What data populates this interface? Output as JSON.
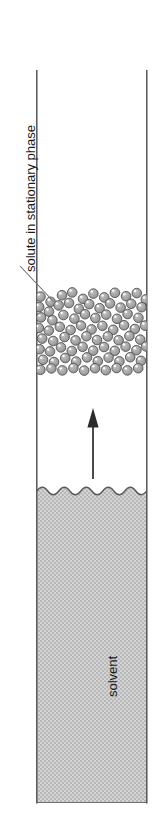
{
  "figure": {
    "background_color": "#ffffff",
    "width": 164,
    "height": 840
  },
  "labels": {
    "solute": "solute in stationary phase",
    "solvent": "solvent"
  },
  "colors": {
    "outline": "#555555",
    "sphere_fill": "#a8a8a8",
    "sphere_outline": "#4d4d4d",
    "sphere_highlight": "#ffffff",
    "solvent_fill": "#c9c9c9",
    "text": "#1a1a1a",
    "leader_line": "#6b6b6b",
    "arrow": "#2b2b2b"
  },
  "elements": {
    "column": {
      "name": "column-tube",
      "left_wall_x": 36,
      "right_wall_x": 147,
      "top_y": 70,
      "bottom_y": 803
    },
    "solute_band": {
      "name": "solute-particle-band",
      "top_y": 290,
      "bottom_y": 374,
      "sphere_diameter": 9.6,
      "sphere_count": 62
    },
    "solvent_surface": {
      "name": "solvent-meniscus-wave",
      "y": 491,
      "wavelength": 22,
      "amplitude": 4.6,
      "periods": 5
    },
    "solvent_body": {
      "name": "solvent-region",
      "top_y": 491,
      "bottom_y": 803
    },
    "flow_arrow": {
      "name": "solvent-flow-arrow",
      "direction": "up",
      "x": 93,
      "tail_y": 479,
      "head_y": 409
    },
    "leader": {
      "name": "solute-leader-line",
      "x1": 20,
      "y1": 266,
      "x2": 53,
      "y2": 301
    }
  }
}
